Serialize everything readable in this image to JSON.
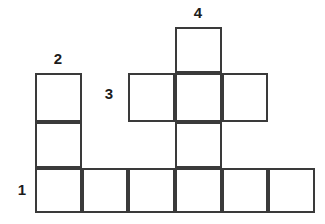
{
  "puzzle": {
    "type": "crossword-grid",
    "background_color": "#ffffff",
    "line_color": "#3a3a3a",
    "line_width_px": 2,
    "label_color": "#1c1c1c",
    "cell_size_px": 47,
    "grid_origin": {
      "x": 35,
      "y": 27
    },
    "columns": 6,
    "rows": 4,
    "cells": [
      {
        "id": "cell-r0c3",
        "row": 0,
        "col": 3,
        "x": 175,
        "y": 27,
        "w": 47,
        "h": 46,
        "letter": ""
      },
      {
        "id": "cell-r1c1",
        "row": 1,
        "col": 1,
        "x": 35,
        "y": 73,
        "w": 47,
        "h": 49,
        "letter": ""
      },
      {
        "id": "cell-r1c2",
        "row": 1,
        "col": 2,
        "x": 128,
        "y": 73,
        "w": 47,
        "h": 49,
        "letter": ""
      },
      {
        "id": "cell-r1c3",
        "row": 1,
        "col": 3,
        "x": 175,
        "y": 73,
        "w": 47,
        "h": 49,
        "letter": ""
      },
      {
        "id": "cell-r1c4",
        "row": 1,
        "col": 4,
        "x": 222,
        "y": 73,
        "w": 46,
        "h": 49,
        "letter": ""
      },
      {
        "id": "cell-r2c1",
        "row": 2,
        "col": 1,
        "x": 35,
        "y": 122,
        "w": 47,
        "h": 46,
        "letter": ""
      },
      {
        "id": "cell-r2c3",
        "row": 2,
        "col": 3,
        "x": 175,
        "y": 122,
        "w": 47,
        "h": 46,
        "letter": ""
      },
      {
        "id": "cell-r3c1",
        "row": 3,
        "col": 1,
        "x": 35,
        "y": 168,
        "w": 47,
        "h": 45,
        "letter": ""
      },
      {
        "id": "cell-r3c2",
        "row": 3,
        "col": 2,
        "x": 82,
        "y": 168,
        "w": 46,
        "h": 45,
        "letter": ""
      },
      {
        "id": "cell-r3c3",
        "row": 3,
        "col": 3,
        "x": 128,
        "y": 168,
        "w": 47,
        "h": 45,
        "letter": ""
      },
      {
        "id": "cell-r3c4",
        "row": 3,
        "col": 4,
        "x": 175,
        "y": 168,
        "w": 47,
        "h": 45,
        "letter": ""
      },
      {
        "id": "cell-r3c5",
        "row": 3,
        "col": 5,
        "x": 222,
        "y": 168,
        "w": 46,
        "h": 45,
        "letter": ""
      },
      {
        "id": "cell-r3c6",
        "row": 3,
        "col": 6,
        "x": 268,
        "y": 168,
        "w": 47,
        "h": 45,
        "letter": ""
      }
    ],
    "clue_numbers": [
      {
        "id": "clue-1",
        "label": "1",
        "x": 11,
        "y": 182,
        "w": 22,
        "h": 20,
        "position": "left-of-row-3",
        "direction": "across"
      },
      {
        "id": "clue-2",
        "label": "2",
        "x": 47,
        "y": 51,
        "w": 22,
        "h": 20,
        "position": "above-column-1",
        "direction": "down"
      },
      {
        "id": "clue-3",
        "label": "3",
        "x": 98,
        "y": 86,
        "w": 22,
        "h": 20,
        "position": "left-of-row-1",
        "direction": "across"
      },
      {
        "id": "clue-4",
        "label": "4",
        "x": 187,
        "y": 5,
        "w": 22,
        "h": 20,
        "position": "above-column-3",
        "direction": "down"
      }
    ]
  }
}
